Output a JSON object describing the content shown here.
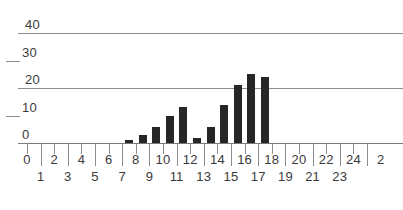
{
  "chart_data": {
    "type": "bar",
    "title": "",
    "subtitle": "",
    "xlabel": "",
    "ylabel": "",
    "grid": true,
    "legend": null,
    "legend_position": "none",
    "bar_color": "#262626",
    "grid_color": "#8d8d8d",
    "axis_color": "#7a7a7a",
    "text_color": "#3a3a3a",
    "background": "#ffffff",
    "xlim": [
      0,
      25
    ],
    "ylim": [
      0,
      44
    ],
    "y_major_ticks": [
      40,
      20
    ],
    "y_minor_ticks": [
      30,
      10
    ],
    "y_tick_labels": [
      "40",
      "30",
      "20",
      "10",
      "0"
    ],
    "y_tick_values": [
      40,
      30,
      20,
      10,
      0
    ],
    "x_tick_values": [
      0,
      1,
      2,
      3,
      4,
      5,
      6,
      7,
      8,
      9,
      10,
      11,
      12,
      13,
      14,
      15,
      16,
      17,
      18,
      19,
      20,
      21,
      22,
      23,
      24,
      25
    ],
    "x_tick_labels_top": [
      "0",
      "2",
      "4",
      "6",
      "8",
      "10",
      "12",
      "14",
      "16",
      "18",
      "20",
      "22",
      "24"
    ],
    "x_tick_labels_bottom": [
      "1",
      "3",
      "5",
      "7",
      "9",
      "11",
      "13",
      "15",
      "17",
      "19",
      "21",
      "23"
    ],
    "x_tick_label_clipped_right": "2",
    "categories": [
      7,
      8,
      9,
      10,
      11,
      12,
      13,
      14,
      15,
      16,
      17
    ],
    "values": [
      1,
      3,
      6,
      10,
      13,
      2,
      6,
      14,
      21,
      25,
      24
    ],
    "bars": [
      {
        "bin": 7,
        "value": 1
      },
      {
        "bin": 8,
        "value": 3
      },
      {
        "bin": 9,
        "value": 6
      },
      {
        "bin": 10,
        "value": 10
      },
      {
        "bin": 11,
        "value": 13
      },
      {
        "bin": 12,
        "value": 2
      },
      {
        "bin": 13,
        "value": 6
      },
      {
        "bin": 14,
        "value": 14
      },
      {
        "bin": 15,
        "value": 21
      },
      {
        "bin": 16,
        "value": 25
      },
      {
        "bin": 17,
        "value": 24
      }
    ]
  }
}
